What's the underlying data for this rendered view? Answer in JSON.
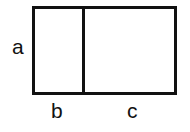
{
  "diagram": {
    "labels": {
      "height": "a",
      "left_width": "b",
      "right_width": "c"
    },
    "stroke_color": "#111111"
  }
}
